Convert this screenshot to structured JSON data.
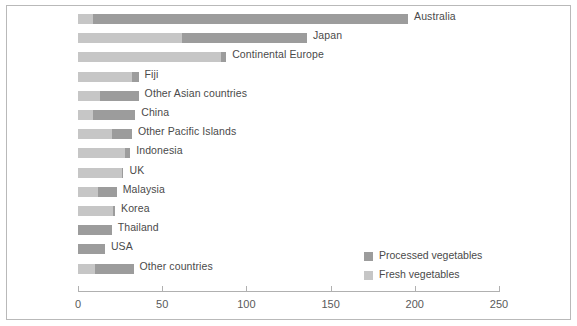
{
  "chart_data": {
    "type": "bar",
    "orientation": "horizontal",
    "stacked": true,
    "title": "",
    "xlabel": "",
    "ylabel": "",
    "xlim": [
      0,
      250
    ],
    "xticks": [
      0,
      50,
      100,
      150,
      200,
      250
    ],
    "xtick_labels": [
      "0",
      "50",
      "100",
      "150",
      "200",
      "250"
    ],
    "grid": false,
    "legend_position": "inside-bottom-right",
    "categories": [
      "Australia",
      "Japan",
      "Continental Europe",
      "Fiji",
      "Other Asian countries",
      "China",
      "Other Pacific Islands",
      "Indonesia",
      "UK",
      "Malaysia",
      "Korea",
      "Thailand",
      "USA",
      "Other countries"
    ],
    "series": [
      {
        "name": "Fresh vegetables",
        "color": "#c6c6c6",
        "values": [
          9,
          62,
          85,
          32,
          13,
          9,
          20,
          28,
          26,
          12,
          21,
          0,
          0,
          10
        ]
      },
      {
        "name": "Processed vegetables",
        "color": "#9c9c9c",
        "values": [
          187,
          74,
          3,
          4,
          23,
          25,
          12,
          3,
          1,
          11,
          1,
          20,
          16,
          23
        ]
      }
    ],
    "totals": [
      196,
      136,
      88,
      36,
      36,
      34,
      32,
      31,
      27,
      23,
      22,
      20,
      16,
      33
    ]
  },
  "legend": {
    "items": [
      {
        "label": "Processed vegetables",
        "color": "#9c9c9c",
        "swatch": "legend-swatch-processed"
      },
      {
        "label": "Fresh vegetables",
        "color": "#c6c6c6",
        "swatch": "legend-swatch-fresh"
      }
    ]
  },
  "colors": {
    "fresh": "#c6c6c6",
    "processed": "#9c9c9c",
    "axis": "#b0b0b0",
    "text": "#4a4a4a",
    "frame": "#b9b9b9",
    "background": "#ffffff"
  }
}
